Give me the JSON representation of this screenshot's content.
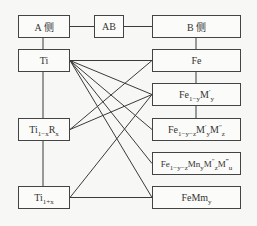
{
  "diagram": {
    "header": {
      "a_side": "A 侧",
      "ab": "AB",
      "b_side": "B 侧"
    },
    "a_nodes": [
      {
        "id": "ti",
        "base": "Ti",
        "sub": ""
      },
      {
        "id": "ti1-xrx",
        "base": "Ti",
        "sub": "1−x",
        "rest": "R",
        "rest_sub": "x"
      },
      {
        "id": "ti1+x",
        "base": "Ti",
        "sub": "1+x"
      }
    ],
    "b_nodes": [
      {
        "id": "fe",
        "label": "Fe"
      },
      {
        "id": "fe1-y-m1y",
        "label": "Fe1−yM′y"
      },
      {
        "id": "fe1-y-z-m1y-m2z",
        "label": "Fe1−y−zM′yM″z"
      },
      {
        "id": "fe1-y-z-mny-m2z-m3u",
        "label": "Fe1−y−zMnyM″zM‴u"
      },
      {
        "id": "femmy",
        "label": "FeMmy"
      }
    ],
    "connections": [
      {
        "from": "Ti",
        "to": "Fe"
      },
      {
        "from": "Ti",
        "to": "Fe1−yM′y"
      },
      {
        "from": "Ti",
        "to": "Fe1−y−zM′yM″z"
      },
      {
        "from": "Ti",
        "to": "Fe1−y−zMnyM″zM‴u"
      },
      {
        "from": "Ti",
        "to": "FeMmy"
      },
      {
        "from": "Ti1−xRx",
        "to": "Fe"
      },
      {
        "from": "Ti1−xRx",
        "to": "Fe1−yM′y"
      },
      {
        "from": "Ti1+x",
        "to": "Fe1−yM′y"
      },
      {
        "from": "Ti1+x",
        "to": "FeMmy"
      }
    ],
    "text": {
      "ti": "Ti",
      "ti_r_base": "Ti",
      "ti_r_sub": "1−x",
      "ti_r_r": "R",
      "ti_r_rsub": "x",
      "ti_p_base": "Ti",
      "ti_p_sub": "1+x",
      "fe": "Fe",
      "b2_fe": "Fe",
      "b2_sub": "1−y",
      "b2_m": "M",
      "b2_sup": "′",
      "b2_msub": "y",
      "b3_fe": "Fe",
      "b3_sub": "1−y−z",
      "b3_m1": "M",
      "b3_m1sup": "′",
      "b3_m1sub": "y",
      "b3_m2": "M",
      "b3_m2sup": "″",
      "b3_m2sub": "z",
      "b4_fe": "Fe",
      "b4_sub": "1−y−z",
      "b4_mn": "Mn",
      "b4_mnsub": "y",
      "b4_m2": "M",
      "b4_m2sup": "″",
      "b4_m2sub": "z",
      "b4_m3": "M",
      "b4_m3sup": "‴",
      "b4_m3sub": "u",
      "b5_fe": "FeMm",
      "b5_sub": "y"
    }
  }
}
